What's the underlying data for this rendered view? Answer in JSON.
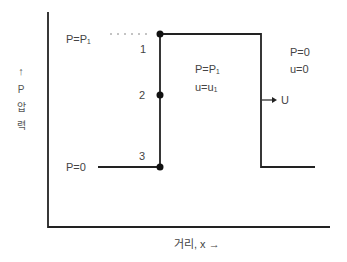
{
  "diagram": {
    "axes": {
      "y_arrow": "↑",
      "y_symbol": "P",
      "y_label_chars": [
        "압",
        "력"
      ],
      "x_label": "거리, x →"
    },
    "levels": {
      "high": "P=P₁",
      "low": "P=0"
    },
    "points": [
      {
        "id": "1",
        "label": "1"
      },
      {
        "id": "2",
        "label": "2"
      },
      {
        "id": "3",
        "label": "3"
      }
    ],
    "region_inside": {
      "pressure": "P=P₁",
      "velocity": "u=u₁"
    },
    "region_ahead": {
      "pressure": "P=0",
      "velocity": "u=0"
    },
    "front_velocity": "→ U",
    "colors": {
      "line": "#222222",
      "text": "#444444",
      "dots": "#111111",
      "dotted": "#888888"
    }
  }
}
